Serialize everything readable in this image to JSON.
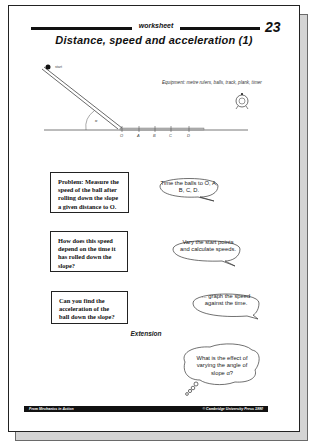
{
  "header": {
    "label": "worksheet",
    "page_number": "23",
    "title": "Distance, speed and acceleration (1)"
  },
  "diagram": {
    "start_label": "start",
    "angle_label": "α",
    "points": [
      "O",
      "A",
      "B",
      "C",
      "D"
    ],
    "equipment": "Equipment: metre rulers, balls, track, plank, timer",
    "timer_icon": "stopwatch-icon"
  },
  "tasks": [
    {
      "box_text": "Problem: Measure the speed of the ball after rolling down the slope a given distance to O.",
      "bubble_text": "Time the balls to O, A, B, C, D."
    },
    {
      "box_text": "How does this speed depend on the time it has rolled down the slope?",
      "bubble_text": "Vary the start points and calculate speeds."
    },
    {
      "box_text": "Can you find the acceleration of the ball down the slope?",
      "bubble_text": "... graph the speed against the time."
    }
  ],
  "extension": {
    "heading": "Extension",
    "thought_text": "What is the effect of varying the angle of slope α?"
  },
  "footer": {
    "left": "From Mechanics in Action",
    "right": "© Cambridge University Press 1990"
  }
}
